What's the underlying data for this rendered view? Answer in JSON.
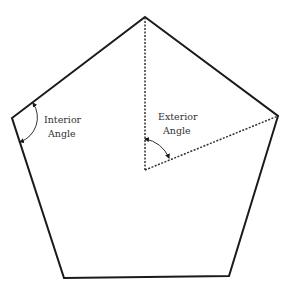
{
  "diagram": {
    "shape": "regular-pentagon",
    "colors": {
      "stroke": "#1a1a1a",
      "label": "#333333",
      "background": "#ffffff"
    },
    "labels": {
      "interior": {
        "line1": "Interior",
        "line2": "Angle"
      },
      "exterior": {
        "line1": "Exterior",
        "line2": "Angle"
      }
    }
  }
}
